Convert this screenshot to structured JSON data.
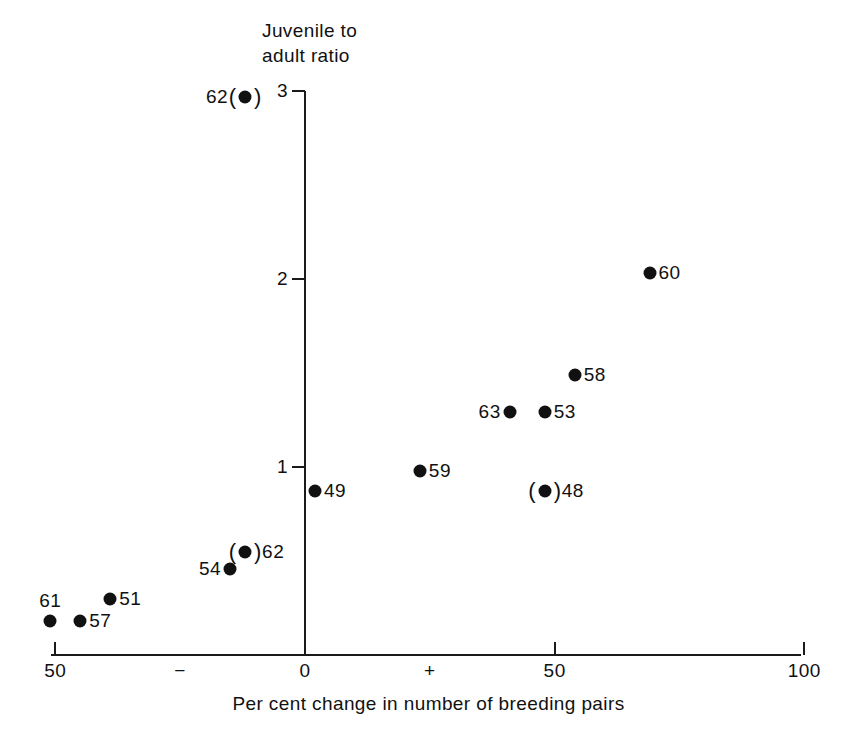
{
  "chart_data": {
    "type": "scatter",
    "title": "",
    "ylabel": "Juvenile to\nadult ratio",
    "xlabel": "Per cent change in number of breeding pairs",
    "xlim": [
      -50,
      100
    ],
    "ylim": [
      0,
      3.05
    ],
    "grid": false,
    "legend": null,
    "x_ticks": [
      {
        "value": -50,
        "label": "50"
      },
      {
        "value": -25,
        "label": "−"
      },
      {
        "value": 0,
        "label": "0"
      },
      {
        "value": 25,
        "label": "+"
      },
      {
        "value": 50,
        "label": "50"
      },
      {
        "value": 100,
        "label": "100"
      }
    ],
    "x_tick_marks": [
      -50,
      0,
      50,
      100
    ],
    "y_ticks": [
      {
        "value": 1,
        "label": "1"
      },
      {
        "value": 2,
        "label": "2"
      },
      {
        "value": 3,
        "label": "3"
      }
    ],
    "points": [
      {
        "label": "62",
        "x": -12,
        "y": 2.97,
        "label_side": "left",
        "parenthesised": true
      },
      {
        "label": "60",
        "x": 69,
        "y": 2.03,
        "label_side": "right",
        "parenthesised": false
      },
      {
        "label": "58",
        "x": 54,
        "y": 1.49,
        "label_side": "right",
        "parenthesised": false
      },
      {
        "label": "63",
        "x": 41,
        "y": 1.29,
        "label_side": "left",
        "parenthesised": false
      },
      {
        "label": "53",
        "x": 48,
        "y": 1.29,
        "label_side": "right",
        "parenthesised": false
      },
      {
        "label": "59",
        "x": 23,
        "y": 0.98,
        "label_side": "right",
        "parenthesised": false
      },
      {
        "label": "49",
        "x": 2,
        "y": 0.87,
        "label_side": "right",
        "parenthesised": false
      },
      {
        "label": "48",
        "x": 48,
        "y": 0.87,
        "label_side": "right",
        "parenthesised": true
      },
      {
        "label": "62",
        "x": -12,
        "y": 0.55,
        "label_side": "right",
        "parenthesised": true
      },
      {
        "label": "54",
        "x": -15,
        "y": 0.46,
        "label_side": "left",
        "parenthesised": false
      },
      {
        "label": "51",
        "x": -39,
        "y": 0.3,
        "label_side": "right",
        "parenthesised": false
      },
      {
        "label": "57",
        "x": -45,
        "y": 0.18,
        "label_side": "right",
        "parenthesised": false
      },
      {
        "label": "61",
        "x": -51,
        "y": 0.18,
        "label_side": "above",
        "parenthesised": false
      }
    ]
  }
}
